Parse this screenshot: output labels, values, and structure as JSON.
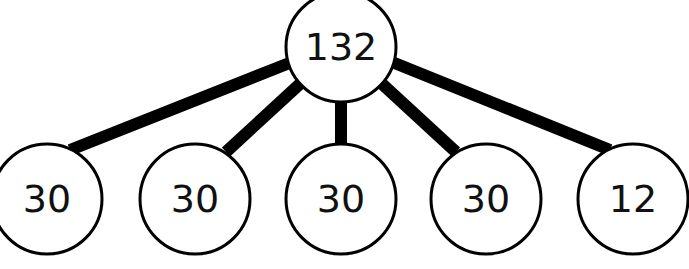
{
  "diagram": {
    "type": "tree",
    "root": {
      "label": "132",
      "cx": 341,
      "cy": 47,
      "r": 55
    },
    "children": [
      {
        "label": "30",
        "cx": 47,
        "cy": 199,
        "r": 55
      },
      {
        "label": "30",
        "cx": 195,
        "cy": 199,
        "r": 55
      },
      {
        "label": "30",
        "cx": 341,
        "cy": 199,
        "r": 55
      },
      {
        "label": "30",
        "cx": 486,
        "cy": 199,
        "r": 55
      },
      {
        "label": "12",
        "cx": 633,
        "cy": 199,
        "r": 55
      }
    ],
    "edges": [
      {
        "x1": 292,
        "y1": 62,
        "x2": 70,
        "y2": 150
      },
      {
        "x1": 302,
        "y1": 82,
        "x2": 226,
        "y2": 152
      },
      {
        "x1": 341,
        "y1": 100,
        "x2": 341,
        "y2": 146
      },
      {
        "x1": 380,
        "y1": 82,
        "x2": 456,
        "y2": 152
      },
      {
        "x1": 392,
        "y1": 62,
        "x2": 610,
        "y2": 150
      }
    ],
    "colors": {
      "line": "#000000",
      "fill": "#ffffff",
      "text": "#111111"
    }
  }
}
